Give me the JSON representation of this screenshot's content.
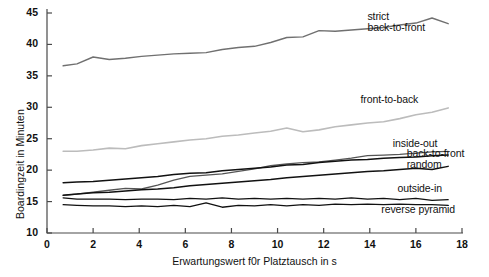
{
  "chart_data": {
    "type": "line",
    "title": "",
    "xlabel": "Erwartungswert f0r Platztausch in s",
    "ylabel": "Boardingzeit in Minuten",
    "xlim": [
      0,
      18
    ],
    "ylim": [
      10,
      45
    ],
    "xticks": [
      0,
      2,
      4,
      6,
      8,
      10,
      12,
      14,
      16,
      18
    ],
    "yticks": [
      10,
      15,
      20,
      25,
      30,
      35,
      40,
      45
    ],
    "grid": false,
    "legend_position": "inline-right-annotations",
    "x": [
      0.7,
      1.3,
      2.0,
      2.7,
      3.4,
      4.1,
      4.8,
      5.5,
      6.2,
      6.9,
      7.6,
      8.3,
      9.0,
      9.7,
      10.4,
      11.1,
      11.8,
      12.5,
      13.2,
      13.9,
      14.6,
      15.3,
      16.0,
      16.7,
      17.4
    ],
    "series": [
      {
        "name": "strict back-to-front",
        "color": "#707070",
        "width": 1.4,
        "values": [
          36.6,
          36.9,
          38.0,
          37.6,
          37.8,
          38.1,
          38.3,
          38.5,
          38.6,
          38.7,
          39.2,
          39.5,
          39.7,
          40.3,
          41.1,
          41.2,
          42.2,
          42.1,
          42.3,
          42.5,
          42.7,
          43.1,
          43.4,
          44.2,
          43.3
        ]
      },
      {
        "name": "front-to-back",
        "color": "#bcbcbc",
        "width": 1.6,
        "values": [
          23.0,
          23.0,
          23.2,
          23.5,
          23.4,
          23.9,
          24.2,
          24.5,
          24.8,
          25.0,
          25.4,
          25.6,
          25.9,
          26.2,
          26.7,
          26.1,
          26.4,
          26.9,
          27.2,
          27.5,
          27.7,
          28.2,
          28.8,
          29.2,
          29.9
        ]
      },
      {
        "name": "inside-out",
        "color": "#555555",
        "width": 1.3,
        "values": [
          16.0,
          16.2,
          16.5,
          16.8,
          17.1,
          17.0,
          17.6,
          18.4,
          19.0,
          19.2,
          19.4,
          19.8,
          20.2,
          20.7,
          21.0,
          21.2,
          21.3,
          21.6,
          21.9,
          22.3,
          22.4,
          22.5,
          22.7,
          22.9,
          23.0
        ]
      },
      {
        "name": "back-to-front",
        "color": "#111111",
        "width": 1.5,
        "values": [
          18.0,
          18.1,
          18.2,
          18.4,
          18.6,
          18.8,
          19.0,
          19.3,
          19.5,
          19.6,
          19.9,
          20.1,
          20.3,
          20.5,
          20.8,
          20.9,
          21.2,
          21.4,
          21.6,
          21.7,
          21.9,
          22.0,
          22.1,
          22.3,
          22.4
        ]
      },
      {
        "name": "random",
        "color": "#111111",
        "width": 1.5,
        "values": [
          16.0,
          16.2,
          16.4,
          16.5,
          16.7,
          16.9,
          17.0,
          17.2,
          17.5,
          17.7,
          17.9,
          18.1,
          18.3,
          18.5,
          18.8,
          19.0,
          19.2,
          19.4,
          19.6,
          19.8,
          19.9,
          20.1,
          20.3,
          20.1,
          20.6
        ]
      },
      {
        "name": "outside-in",
        "color": "#111111",
        "width": 1.3,
        "values": [
          15.6,
          15.4,
          15.4,
          15.4,
          15.3,
          15.4,
          15.4,
          15.3,
          15.5,
          15.4,
          15.6,
          15.4,
          15.5,
          15.4,
          15.5,
          15.4,
          15.5,
          15.4,
          15.6,
          15.4,
          15.5,
          15.3,
          15.5,
          15.2,
          15.3
        ]
      },
      {
        "name": "reverse pyramid",
        "color": "#111111",
        "width": 1.3,
        "values": [
          14.5,
          14.4,
          14.3,
          14.3,
          14.2,
          14.3,
          14.2,
          14.4,
          14.2,
          14.8,
          14.1,
          14.4,
          14.3,
          14.5,
          14.3,
          14.5,
          14.4,
          14.6,
          14.5,
          14.6,
          14.5,
          14.6,
          14.5,
          14.5,
          14.4
        ]
      }
    ],
    "annotations": [
      {
        "text": "strict",
        "x": 13.9,
        "y": 44.3,
        "align": "left"
      },
      {
        "text": "back-to-front",
        "x": 13.9,
        "y": 42.6,
        "align": "left"
      },
      {
        "text": "front-to-back",
        "x": 13.6,
        "y": 31.2,
        "align": "left"
      },
      {
        "text": "inside-out",
        "x": 15.0,
        "y": 24.1,
        "align": "left"
      },
      {
        "text": "back-to-front",
        "x": 15.6,
        "y": 22.6,
        "align": "left"
      },
      {
        "text": "random",
        "x": 15.6,
        "y": 20.8,
        "align": "left"
      },
      {
        "text": "outside-in",
        "x": 15.2,
        "y": 17.0,
        "align": "left"
      },
      {
        "text": "reverse pyramid",
        "x": 14.5,
        "y": 13.6,
        "align": "left"
      }
    ]
  }
}
